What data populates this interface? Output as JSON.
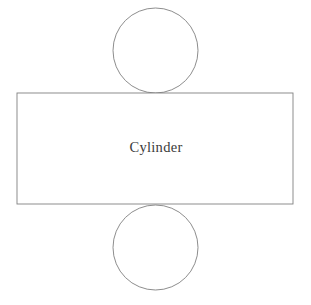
{
  "diagram": {
    "name": "cylinder-net",
    "title": "Cylinder",
    "background_color": "#ffffff",
    "stroke_color": "#808080",
    "label_color": "#3a3a3a",
    "canvas": {
      "width": 311,
      "height": 305
    },
    "labels": {
      "body_label": "Cylinder"
    },
    "shapes": {
      "lateral_surface": {
        "kind": "rectangle",
        "label": "Cylinder",
        "x": 17,
        "y": 93,
        "width": 276,
        "height": 111
      },
      "top_base": {
        "kind": "circle",
        "cx": 155.5,
        "cy": 50.5,
        "r": 42.5
      },
      "bottom_base": {
        "kind": "circle",
        "cx": 155.5,
        "cy": 247.5,
        "r": 42.5
      }
    },
    "label_position": {
      "x": 156,
      "y": 152
    }
  }
}
